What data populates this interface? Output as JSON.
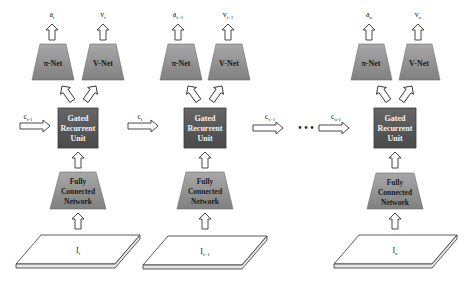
{
  "diagram": {
    "type": "recurrent actor-critic architecture",
    "colors": {
      "trapezoid_fill": "#8c8c8c",
      "trapezoid_top": "#a5a5a5",
      "gru_fill": "#5a5a5a",
      "gru_border": "#3a3a3a",
      "arrow_fill": "#ffffff",
      "arrow_stroke": "#333333",
      "plate_fill": "#ffffff",
      "plate_stroke": "#333333"
    },
    "columns": [
      {
        "output_action": {
          "base": "a",
          "sub": "t"
        },
        "output_value": {
          "base": "v",
          "sub": "t"
        },
        "policy_net": "π-Net",
        "value_net": "V-Net",
        "gru": [
          "Gated",
          "Recurrent",
          "Unit"
        ],
        "fcn": [
          "Fully",
          "Connected",
          "Network"
        ],
        "input": {
          "base": "I",
          "sub": "t"
        },
        "state_in": {
          "base": "c",
          "sub": "t-1"
        }
      },
      {
        "output_action": {
          "base": "a",
          "sub": "t+1"
        },
        "output_value": {
          "base": "v",
          "sub": "t+1"
        },
        "policy_net": "π-Net",
        "value_net": "V-Net",
        "gru": [
          "Gated",
          "Recurrent",
          "Unit"
        ],
        "fcn": [
          "Fully",
          "Connected",
          "Network"
        ],
        "input": {
          "base": "I",
          "sub": "t+1"
        },
        "state_in": {
          "base": "c",
          "sub": "t"
        }
      },
      {
        "output_action": {
          "base": "a",
          "sub": "n"
        },
        "output_value": {
          "base": "v",
          "sub": "n"
        },
        "policy_net": "π-Net",
        "value_net": "V-Net",
        "gru": [
          "Gated",
          "Recurrent",
          "Unit"
        ],
        "fcn": [
          "Fully",
          "Connected",
          "Network"
        ],
        "input": {
          "base": "I",
          "sub": "n"
        },
        "state_in": {
          "base": "c",
          "sub": "n-1"
        }
      }
    ],
    "between": {
      "state_out": {
        "base": "c",
        "sub": "t+1"
      },
      "ellipsis": "• • •"
    }
  }
}
